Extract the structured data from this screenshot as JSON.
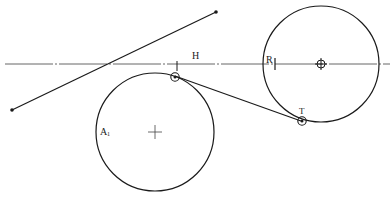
{
  "diagram": {
    "labels": {
      "H": "H",
      "R": "R",
      "A": "A",
      "A_sub": "1",
      "T": "T"
    },
    "colors": {
      "stroke": "#1a1a1a",
      "centerline": "#555555",
      "background": "#ffffff"
    },
    "elements": {
      "horizontal_centerline": {
        "y": 64,
        "x1": 5,
        "x2": 390,
        "style": "dash-dot"
      },
      "diagonal_segment": {
        "x1": 12,
        "y1": 110,
        "x2": 216,
        "y2": 12
      },
      "left_circle": {
        "cx": 155,
        "cy": 132,
        "r": 59,
        "label": "A1"
      },
      "right_circle": {
        "cx": 321,
        "cy": 64,
        "r": 58
      },
      "tangent_point_left": {
        "x": 175,
        "y": 76
      },
      "tangent_point_T": {
        "x": 301,
        "y": 121,
        "label": "T"
      },
      "tangent_line": {
        "x1": 175,
        "y1": 76,
        "x2": 301,
        "y2": 121
      }
    }
  }
}
